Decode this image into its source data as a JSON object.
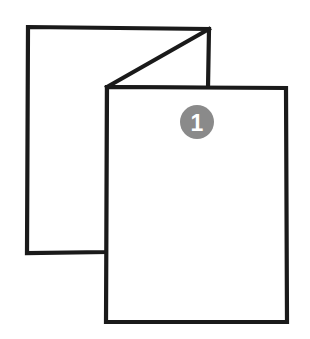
{
  "diagram": {
    "title": "Folded sheet step illustration",
    "background_color": "#ffffff",
    "line_color": "#1a1a1a",
    "line_width": 4.2,
    "step_badge": {
      "label": "1",
      "fill_color": "#8a8a8a",
      "text_color": "#ffffff",
      "center_x": 197,
      "center_y": 122,
      "radius": 17
    },
    "shapes": {
      "back_sheet": {
        "name": "back-panel",
        "fill_color": "#ffffff",
        "points": "28,27 209,29 208,88 107,87 107,252 27,253"
      },
      "front_sheet": {
        "name": "front-panel",
        "fill_color": "#ffffff",
        "points": "107,87 286,88 287,322 106,322"
      },
      "fold_crease": {
        "name": "diagonal-fold-crease",
        "x1": 209,
        "y1": 29,
        "x2": 107,
        "y2": 87
      }
    }
  }
}
